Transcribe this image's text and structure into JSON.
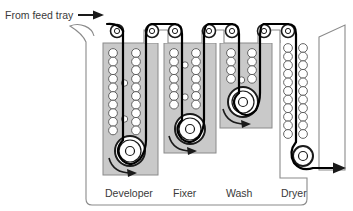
{
  "figure": {
    "type": "schematic-cross-section",
    "background_color": "#ffffff"
  },
  "labels": {
    "feed": "From feed tray",
    "developer": "Developer",
    "fixer": "Fixer",
    "wash": "Wash",
    "dryer": "Dryer"
  },
  "colors": {
    "solution_fill": "#c9c9c9",
    "outline": "#1a1a1a",
    "cabinet_outline": "#8a8a8a",
    "roller_outline": "#555555",
    "text": "#3a3a3a",
    "film_path": "#000000"
  },
  "icons": {
    "feed_arrow": "arrow-right",
    "exit_arrow": "arrow-right",
    "rotation_arrow": "arrow-curved-right"
  },
  "sections": [
    {
      "name": "developer",
      "label": "Developer",
      "filled": true,
      "fill_color": "#c9c9c9",
      "tank_x": 103,
      "tank_y": 43,
      "tank_width": 55,
      "tank_height": 132,
      "roller_columns": 2,
      "rollers_per_column": 13,
      "turnaround_roller": {
        "cx": 130,
        "cy": 151,
        "r": 15
      }
    },
    {
      "name": "fixer",
      "label": "Fixer",
      "filled": true,
      "fill_color": "#c9c9c9",
      "tank_x": 164,
      "tank_y": 43,
      "tank_width": 52,
      "tank_height": 110,
      "roller_columns": 2,
      "rollers_per_column": 10,
      "turnaround_roller": {
        "cx": 190,
        "cy": 129,
        "r": 15
      }
    },
    {
      "name": "wash",
      "label": "Wash",
      "filled": true,
      "fill_color": "#c9c9c9",
      "tank_x": 220,
      "tank_y": 43,
      "tank_width": 52,
      "tank_height": 85,
      "roller_columns": 2,
      "rollers_per_column": 6,
      "turnaround_roller": {
        "cx": 246,
        "cy": 104,
        "r": 15
      }
    },
    {
      "name": "dryer",
      "label": "Dryer",
      "filled": false,
      "roller_columns": 2,
      "rollers_per_column": 15,
      "exit_roller": {
        "cx": 305,
        "cy": 157,
        "r": 10
      }
    }
  ],
  "top_crossover_rollers": [
    {
      "cx": 117,
      "cy": 31,
      "r": 6
    },
    {
      "cx": 152,
      "cy": 31,
      "r": 6
    },
    {
      "cx": 175,
      "cy": 31,
      "r": 6
    },
    {
      "cx": 209,
      "cy": 31,
      "r": 6
    },
    {
      "cx": 232,
      "cy": 31,
      "r": 6
    },
    {
      "cx": 264,
      "cy": 31,
      "r": 6
    },
    {
      "cx": 288,
      "cy": 31,
      "r": 6
    }
  ]
}
